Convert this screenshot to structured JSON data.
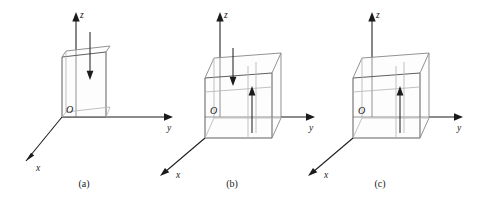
{
  "figure": {
    "type": "diagram",
    "background_color": "#ffffff",
    "axis_color": "#1b1b1b",
    "box_edge_color": "#8c8c8c",
    "arrow_color": "#1b1b1b",
    "panels": [
      {
        "id": "a",
        "caption": "(a)",
        "origin_label": "O",
        "axes": [
          {
            "name": "z-axis",
            "label": "z",
            "direction": "up"
          },
          {
            "name": "y-axis",
            "label": "y",
            "direction": "right"
          },
          {
            "name": "x-axis",
            "label": "x",
            "direction": "down-left"
          }
        ],
        "box": {
          "shape": "thin-slab",
          "depth_extent": "minimal",
          "arrow_count": 1
        },
        "arrows": [
          {
            "name": "downward-flux-arrow",
            "direction": "down"
          }
        ]
      },
      {
        "id": "b",
        "caption": "(b)",
        "origin_label": "O",
        "axes": [
          {
            "name": "z-axis",
            "label": "z",
            "direction": "up"
          },
          {
            "name": "y-axis",
            "label": "y",
            "direction": "right"
          },
          {
            "name": "x-axis",
            "label": "x",
            "direction": "down-left"
          }
        ],
        "box": {
          "shape": "cube",
          "depth_extent": "full",
          "arrow_count": 2
        },
        "arrows": [
          {
            "name": "downward-flux-arrow",
            "direction": "down"
          },
          {
            "name": "upward-flux-arrow",
            "direction": "up"
          }
        ]
      },
      {
        "id": "c",
        "caption": "(c)",
        "origin_label": "O",
        "axes": [
          {
            "name": "z-axis",
            "label": "z",
            "direction": "up"
          },
          {
            "name": "y-axis",
            "label": "y",
            "direction": "right"
          },
          {
            "name": "x-axis",
            "label": "x",
            "direction": "down-left"
          }
        ],
        "box": {
          "shape": "cube",
          "depth_extent": "full",
          "arrow_count": 1
        },
        "arrows": [
          {
            "name": "upward-flux-arrow",
            "direction": "up"
          }
        ]
      }
    ]
  }
}
